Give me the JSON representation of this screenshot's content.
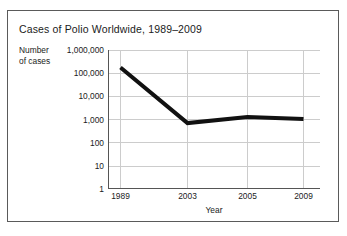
{
  "chart_data": {
    "type": "line",
    "title": "Cases of Polio Worldwide, 1989–2009",
    "xlabel": "Year",
    "ylabel": "Number\nof cases",
    "ylabel_line1": "Number",
    "ylabel_line2": "of cases",
    "yscale": "log",
    "ylim": [
      1,
      1000000
    ],
    "ytick_labels": [
      "1,000,000",
      "100,000",
      "10,000",
      "1,000",
      "100",
      "10",
      "1"
    ],
    "ytick_values": [
      1000000,
      100000,
      10000,
      1000,
      100,
      10,
      1
    ],
    "xtick_labels": [
      "1989",
      "2003",
      "2005",
      "2009"
    ],
    "x": [
      1989,
      2003,
      2005,
      2009
    ],
    "values": [
      175000,
      700,
      1300,
      1050
    ],
    "grid": true,
    "legend": "none",
    "line_color": "#111111",
    "line_width": 4,
    "grid_color": "#cccccc",
    "axis_color": "#555555"
  },
  "figure": {
    "border_color": "#5a5a5a",
    "background": "#ffffff"
  }
}
